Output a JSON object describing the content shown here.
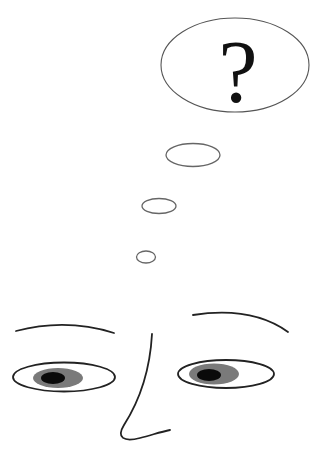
{
  "illustration": {
    "description": "Line drawing of a confused face with a thought bubble containing a question mark",
    "thought_bubble": {
      "symbol": "?",
      "stroke_color": "#555555",
      "fill_color": "#ffffff"
    },
    "trail_bubbles": [
      {
        "cx": 193,
        "cy": 155,
        "rx": 27,
        "ry": 12
      },
      {
        "cx": 159,
        "cy": 206,
        "rx": 17,
        "ry": 7.5
      },
      {
        "cx": 146,
        "cy": 257,
        "rx": 9.5,
        "ry": 6
      }
    ],
    "face": {
      "line_color": "#222222",
      "iris_color": "#7a7a7a",
      "pupil_color": "#0a0a0a"
    }
  }
}
